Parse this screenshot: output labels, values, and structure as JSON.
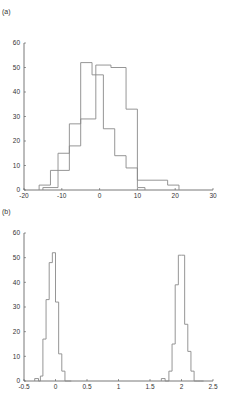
{
  "chart_data": [
    {
      "type": "histogram",
      "panel_label": "(a)",
      "title": "",
      "xlabel": "",
      "ylabel": "",
      "xlim": [
        -20,
        30
      ],
      "ylim": [
        0,
        60
      ],
      "xticks": [
        -20,
        -10,
        0,
        10,
        20,
        30
      ],
      "yticks": [
        0,
        10,
        20,
        30,
        40,
        50,
        60
      ],
      "grid": false,
      "legend": null,
      "series": [
        {
          "name": "series-1",
          "bin_edges": [
            -16,
            -13,
            -11,
            -8,
            -5,
            -2,
            1,
            4,
            7,
            10,
            12
          ],
          "counts": [
            2,
            8,
            15,
            27,
            52,
            47,
            25,
            14,
            9,
            1
          ]
        },
        {
          "name": "series-2",
          "bin_edges": [
            -15,
            -11,
            -8,
            -5,
            -1,
            3,
            7,
            10,
            18,
            21
          ],
          "counts": [
            1,
            8,
            18,
            29,
            51,
            50,
            33,
            4,
            2
          ]
        }
      ]
    },
    {
      "type": "histogram",
      "panel_label": "(b)",
      "title": "",
      "xlabel": "",
      "ylabel": "",
      "xlim": [
        -0.5,
        2.5
      ],
      "ylim": [
        0,
        60
      ],
      "xticks": [
        -0.5,
        0,
        0.5,
        1,
        1.5,
        2,
        2.5
      ],
      "yticks": [
        0,
        10,
        20,
        30,
        40,
        50,
        60
      ],
      "grid": false,
      "legend": null,
      "series": [
        {
          "name": "cluster-near-0",
          "bin_edges": [
            -0.33,
            -0.27,
            -0.24,
            -0.2,
            -0.15,
            -0.1,
            -0.05,
            0.0,
            0.05,
            0.1,
            0.15,
            0.2,
            0.25
          ],
          "counts": [
            1,
            0,
            2,
            17,
            33,
            48,
            52,
            32,
            11,
            4,
            0,
            0
          ]
        },
        {
          "name": "cluster-near-2",
          "bin_edges": [
            1.68,
            1.74,
            1.8,
            1.85,
            1.9,
            1.95,
            2.0,
            2.05,
            2.1,
            2.15,
            2.2,
            2.25,
            2.3,
            2.35
          ],
          "counts": [
            1,
            0,
            4,
            15,
            39,
            51,
            51,
            23,
            12,
            4,
            0,
            0,
            0
          ]
        }
      ]
    }
  ],
  "panels": {
    "a": {
      "label": "(a)"
    },
    "b": {
      "label": "(b)"
    }
  }
}
